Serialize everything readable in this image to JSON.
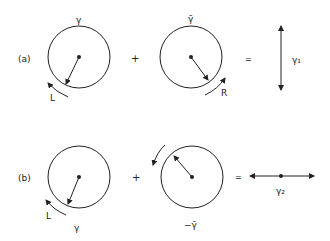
{
  "rows": [
    {
      "label": "(a)",
      "left": {
        "symbol": "γ",
        "arrow_label": "L"
      },
      "plus": "+",
      "right": {
        "symbol": "γ̄",
        "arrow_label": "R"
      },
      "equals": "=",
      "result": {
        "symbol": "γ₁",
        "orientation": "vertical"
      }
    },
    {
      "label": "(b)",
      "left": {
        "symbol": "γ",
        "arrow_label": "L"
      },
      "plus": "+",
      "right": {
        "symbol": "−γ̄"
      },
      "equals": "=",
      "result": {
        "symbol": "γ₂",
        "orientation": "horizontal"
      }
    }
  ],
  "colors": {
    "stroke": "#222222",
    "background": "#ffffff"
  }
}
